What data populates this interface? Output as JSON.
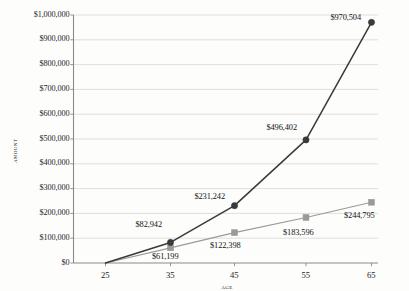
{
  "chart_data": {
    "type": "line",
    "title": "",
    "subtitle": "",
    "xlabel": "Age",
    "ylabel": "Amount",
    "x": [
      25,
      35,
      45,
      55,
      65
    ],
    "categories": [
      "25",
      "35",
      "45",
      "55",
      "65"
    ],
    "xlim": [
      20,
      70
    ],
    "ylim": [
      0,
      1000000
    ],
    "grid": "horizontal",
    "legend": "none",
    "series": [
      {
        "name": "series-dark",
        "marker": "circle",
        "color": "#3a3a3a",
        "values": [
          0,
          82942,
          231242,
          496402,
          970504
        ],
        "labels": [
          "",
          "$82,942",
          "$231,242",
          "$496,402",
          "$970,504"
        ]
      },
      {
        "name": "series-light",
        "marker": "square",
        "color": "#9a9a9a",
        "values": [
          0,
          61199,
          122398,
          183596,
          244795
        ],
        "labels": [
          "",
          "$61,199",
          "$122,398",
          "$183,596",
          "$244,795"
        ]
      }
    ],
    "y_ticks": [
      0,
      100000,
      200000,
      300000,
      400000,
      500000,
      600000,
      700000,
      800000,
      900000,
      1000000
    ],
    "y_tick_labels": [
      "$0",
      "$100,000",
      "$200,000",
      "$300,000",
      "$400,000",
      "$500,000",
      "$600,000",
      "$700,000",
      "$800,000",
      "$900,000",
      "$1,000,000"
    ],
    "x_tick_labels": [
      "25",
      "35",
      "45",
      "55",
      "65"
    ],
    "colors": {
      "series_dark": "#3a3a3a",
      "series_light": "#9a9a9a",
      "gridline": "#d7d7d7",
      "axis": "#8a8a8a",
      "text": "#141414",
      "background": "#fdfdfc"
    }
  },
  "axes": {
    "y_title": "Amount",
    "x_title": "Age"
  },
  "data_labels": [
    {
      "text": "$970,504",
      "series": "series-dark",
      "x": 65
    },
    {
      "text": "$496,402",
      "series": "series-dark",
      "x": 55
    },
    {
      "text": "$231,242",
      "series": "series-dark",
      "x": 45
    },
    {
      "text": "$82,942",
      "series": "series-dark",
      "x": 35
    },
    {
      "text": "$244,795",
      "series": "series-light",
      "x": 65
    },
    {
      "text": "$183,596",
      "series": "series-light",
      "x": 55
    },
    {
      "text": "$122,398",
      "series": "series-light",
      "x": 45
    },
    {
      "text": "$61,199",
      "series": "series-light",
      "x": 35
    }
  ]
}
